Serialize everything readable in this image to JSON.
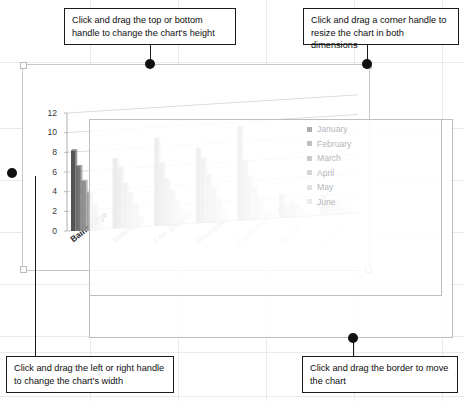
{
  "callouts": [
    {
      "id": "top-height-callout",
      "name": "callout-height-handle",
      "text": "Click and drag the top or bottom handle to change the chart's height"
    },
    {
      "id": "top-corner-callout",
      "name": "callout-corner-handle",
      "text": "Click and drag a corner handle to resize the chart in both dimensions"
    },
    {
      "id": "bottom-width-callout",
      "name": "callout-width-handle",
      "text": "Click and drag the left or right handle to change the chart's width"
    },
    {
      "id": "bottom-move-callout",
      "name": "callout-move-border",
      "text": "Click and drag the border to move the chart"
    }
  ],
  "handles": {
    "top_middle": "top-middle-handle",
    "top_right": "top-right-corner-handle",
    "middle_left": "middle-left-handle",
    "bottom_middle": "bottom-middle-handle"
  },
  "chart_data": {
    "type": "bar",
    "title": "",
    "xlabel": "",
    "ylabel": "",
    "ylim": [
      0,
      12
    ],
    "yticks": [
      12,
      10,
      8,
      6,
      4,
      2,
      0
    ],
    "grid": true,
    "legend_position": "right",
    "perspective": "3-D clustered column",
    "categories": [
      "Bainbridge",
      "Bellevue",
      "Fort Stevens",
      "Mountlake",
      "Anakonna Station",
      "Seattle",
      "Tacoma"
    ],
    "series": [
      {
        "name": "January",
        "color": "#4a4a4a",
        "values": [
          8.2,
          7.1,
          8.9,
          7.6,
          9.6,
          2.4,
          2.0
        ]
      },
      {
        "name": "February",
        "color": "#6f6f6f",
        "values": [
          6.6,
          6.2,
          6.4,
          6.6,
          6.1,
          1.1,
          1.5
        ]
      },
      {
        "name": "March",
        "color": "#8d8d8d",
        "values": [
          5.1,
          4.6,
          4.8,
          4.9,
          4.5,
          1.8,
          1.2
        ]
      },
      {
        "name": "April",
        "color": "#a5a5a5",
        "values": [
          3.9,
          3.6,
          3.6,
          3.7,
          3.4,
          1.3,
          1.9
        ]
      },
      {
        "name": "May",
        "color": "#bcbcbc",
        "values": [
          2.7,
          2.6,
          2.5,
          2.6,
          2.4,
          0.9,
          1.0
        ]
      },
      {
        "name": "June",
        "color": "#d2d2d2",
        "values": [
          1.6,
          1.3,
          1.5,
          1.4,
          1.2,
          0.5,
          0.6
        ]
      }
    ]
  }
}
